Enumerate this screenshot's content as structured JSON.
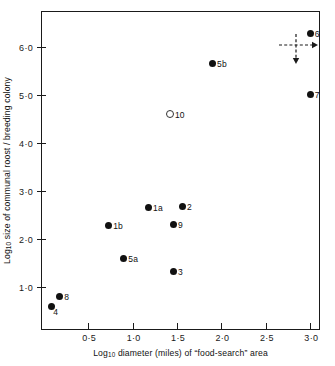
{
  "chart_data": {
    "type": "scatter",
    "title": "",
    "xlabel": "Log10 diameter (miles) of \"food-search\" area",
    "ylabel": "Log10 size of communal roost / breeding colony",
    "xlim": [
      -0.02,
      3.12
    ],
    "ylim": [
      0.08,
      6.72
    ],
    "grid": false,
    "legend": "none",
    "xticks": [
      0.5,
      1.0,
      1.5,
      2.0,
      2.5,
      3.0
    ],
    "xtick_labels": [
      "0·5",
      "1·0",
      "1·5",
      "2·0",
      "2·5",
      "3·0"
    ],
    "yticks": [
      1.0,
      2.0,
      3.0,
      4.0,
      5.0,
      6.0
    ],
    "ytick_labels": [
      "1·0",
      "2·0",
      "3·0",
      "4·0",
      "5·0",
      "6·0"
    ],
    "points": [
      {
        "label": "4",
        "x": 0.09,
        "y": 0.6,
        "filled": true,
        "label_pos": "below-right"
      },
      {
        "label": "8",
        "x": 0.18,
        "y": 0.8,
        "filled": true,
        "label_pos": "right"
      },
      {
        "label": "1b",
        "x": 0.73,
        "y": 2.28,
        "filled": true,
        "label_pos": "right"
      },
      {
        "label": "5a",
        "x": 0.9,
        "y": 1.58,
        "filled": true,
        "label_pos": "right"
      },
      {
        "label": "1a",
        "x": 1.18,
        "y": 2.66,
        "filled": true,
        "label_pos": "right"
      },
      {
        "label": "3",
        "x": 1.46,
        "y": 1.31,
        "filled": true,
        "label_pos": "right"
      },
      {
        "label": "9",
        "x": 1.46,
        "y": 2.3,
        "filled": true,
        "label_pos": "right"
      },
      {
        "label": "2",
        "x": 1.56,
        "y": 2.68,
        "filled": true,
        "label_pos": "right"
      },
      {
        "label": "10",
        "x": 1.42,
        "y": 4.6,
        "filled": false,
        "label_pos": "right"
      },
      {
        "label": "5b",
        "x": 1.9,
        "y": 5.65,
        "filled": true,
        "label_pos": "right"
      },
      {
        "label": "7",
        "x": 3.0,
        "y": 5.0,
        "filled": true,
        "label_pos": "right"
      },
      {
        "label": "6",
        "x": 3.0,
        "y": 6.28,
        "filled": true,
        "label_pos": "right"
      }
    ],
    "annotations": [
      {
        "name": "uncertainty-cross",
        "x": 2.84,
        "y": 6.03,
        "style": "dashed-cross-with-arrows",
        "arrow_right": true,
        "arrow_down": true
      }
    ]
  },
  "colors": {
    "axis": "#1a1a1a",
    "point_fill": "#111111",
    "point_open_stroke": "#333333",
    "background": "#ffffff",
    "annotation": "#1a1a1a"
  }
}
